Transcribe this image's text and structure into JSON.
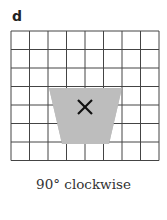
{
  "label": "d",
  "caption": "90° clockwise",
  "grid": {
    "cols": 8,
    "rows": 7,
    "x0": 11,
    "y0": 31,
    "cell": 18.5,
    "line_color": "#444444"
  },
  "shape": {
    "type": "trapezoid",
    "fill": "#bdbdbd",
    "points": [
      [
        49,
        88
      ],
      [
        122,
        88
      ],
      [
        109,
        144
      ],
      [
        62,
        144
      ]
    ],
    "marker": {
      "symbol": "×",
      "cx": 85,
      "cy": 107
    }
  }
}
